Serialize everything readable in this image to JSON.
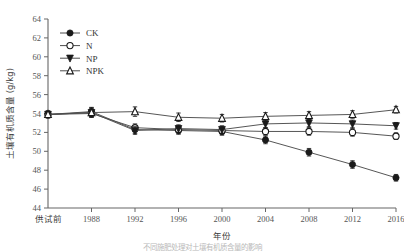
{
  "chart_data": {
    "type": "line",
    "title": "",
    "xlabel": "年份",
    "ylabel": "土壤有机质含量 (g/kg)",
    "ylim": [
      44,
      64
    ],
    "ytick_labels": [
      "44",
      "46",
      "48",
      "50",
      "52",
      "54",
      "56",
      "58",
      "60",
      "62",
      "64"
    ],
    "ytick_values": [
      44,
      46,
      48,
      50,
      52,
      54,
      56,
      58,
      60,
      62,
      64
    ],
    "categories": [
      "供试前",
      "1988",
      "1992",
      "1996",
      "2000",
      "2004",
      "2008",
      "2012",
      "2016"
    ],
    "grid": false,
    "legend_position": "upper-left",
    "series": [
      {
        "name": "CK",
        "marker": "filled-circle",
        "values": [
          53.9,
          54.2,
          52.3,
          52.2,
          52.1,
          51.2,
          49.9,
          48.6,
          47.2
        ],
        "errors": [
          0.35,
          0.45,
          0.4,
          0.4,
          0.4,
          0.4,
          0.4,
          0.4,
          0.35
        ]
      },
      {
        "name": "N",
        "marker": "open-circle",
        "values": [
          53.9,
          54.0,
          52.5,
          52.3,
          52.2,
          52.1,
          52.1,
          52.0,
          51.6
        ],
        "errors": [
          0.35,
          0.4,
          0.4,
          0.4,
          0.4,
          0.4,
          0.4,
          0.4,
          0.35
        ]
      },
      {
        "name": "NP",
        "marker": "filled-triangle-down",
        "values": [
          53.9,
          54.1,
          52.2,
          52.4,
          52.3,
          52.9,
          53.0,
          52.9,
          52.7
        ],
        "errors": [
          0.35,
          0.45,
          0.4,
          0.4,
          0.4,
          0.4,
          0.4,
          0.4,
          0.35
        ]
      },
      {
        "name": "NPK",
        "marker": "open-triangle-up",
        "values": [
          53.9,
          54.1,
          54.2,
          53.6,
          53.5,
          53.7,
          53.8,
          53.9,
          54.4
        ],
        "errors": [
          0.35,
          0.5,
          0.5,
          0.45,
          0.4,
          0.4,
          0.4,
          0.4,
          0.35
        ]
      }
    ],
    "colors": {
      "line": "#4d4d4d",
      "marker_fill": "#1a1a1a",
      "marker_open": "#ffffff",
      "axis": "#666666",
      "text": "#4a4a4a"
    }
  },
  "legend": {
    "items": [
      {
        "label": "CK",
        "marker": "filled-circle"
      },
      {
        "label": "N",
        "marker": "open-circle"
      },
      {
        "label": "NP",
        "marker": "filled-triangle-down"
      },
      {
        "label": "NPK",
        "marker": "open-triangle-up"
      }
    ]
  },
  "caption": {
    "text": "不同施肥处理对土壤有机质含量的影响"
  }
}
